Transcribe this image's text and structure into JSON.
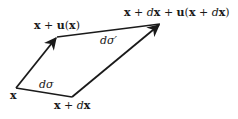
{
  "diagram": {
    "labels": {
      "x": "x",
      "x_plus_u": "x + u(x)",
      "x_plus_dx": "x + dx",
      "x_plus_dx_plus_u": "x + dx + u(x + dx)",
      "dsigma": "dσ",
      "dsigma_prime": "dσ′"
    },
    "points": {
      "x": [
        16,
        88
      ],
      "x_plus_u": [
        57,
        37
      ],
      "x_plus_dx": [
        72,
        97
      ],
      "x_plus_dx_plus_u": [
        160,
        24
      ]
    },
    "edges": [
      {
        "from": "x",
        "to": "x_plus_u",
        "arrow": true,
        "label": "u(x)"
      },
      {
        "from": "x_plus_dx",
        "to": "x_plus_dx_plus_u",
        "arrow": true,
        "label": "u(x+dx)"
      },
      {
        "from": "x",
        "to": "x_plus_dx",
        "arrow": false,
        "label": "dσ"
      },
      {
        "from": "x_plus_u",
        "to": "x_plus_dx_plus_u",
        "arrow": false,
        "label": "dσ′"
      }
    ],
    "colors": {
      "stroke": "#1a1a1a",
      "background": "#ffffff"
    }
  }
}
